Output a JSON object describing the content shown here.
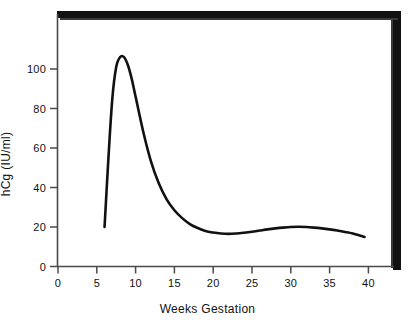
{
  "chart_data": {
    "type": "line",
    "title": "",
    "subtitle": "",
    "xlabel": "Weeks Gestation",
    "ylabel": "hCg (IU/ml)",
    "xlim": [
      0,
      43
    ],
    "ylim": [
      0,
      120
    ],
    "xticks": [
      0,
      5,
      10,
      15,
      20,
      25,
      30,
      35,
      40
    ],
    "yticks": [
      0,
      20,
      40,
      60,
      80,
      100
    ],
    "xtick_labels": [
      "0",
      "5",
      "10",
      "15",
      "20",
      "25",
      "30",
      "35",
      "40"
    ],
    "ytick_labels": [
      "0",
      "20",
      "40",
      "60",
      "80",
      "100"
    ],
    "grid": false,
    "legend": false,
    "legend_position": "none",
    "line_color": "#111111",
    "frame_color": "#000000",
    "series": [
      {
        "name": "hCg",
        "x": [
          6.0,
          6.5,
          7.0,
          7.5,
          8.0,
          8.5,
          9.0,
          9.5,
          10.0,
          11.0,
          12.0,
          13.0,
          14.0,
          15.0,
          16.0,
          17.0,
          18.0,
          19.0,
          20.0,
          21.0,
          22.0,
          23.0,
          24.0,
          25.0,
          26.0,
          27.0,
          28.0,
          29.0,
          30.0,
          31.0,
          32.0,
          33.0,
          34.0,
          35.0,
          36.0,
          37.0,
          38.0,
          39.5
        ],
        "y": [
          20.0,
          55.0,
          85.0,
          101.0,
          106.0,
          106.0,
          102.0,
          95.0,
          86.0,
          68.0,
          53.0,
          42.0,
          34.0,
          28.5,
          24.5,
          21.5,
          19.5,
          18.0,
          17.2,
          16.7,
          16.5,
          16.7,
          17.1,
          17.6,
          18.2,
          18.8,
          19.3,
          19.7,
          20.0,
          20.1,
          20.0,
          19.7,
          19.3,
          18.8,
          18.2,
          17.5,
          16.7,
          15.0
        ]
      }
    ],
    "annotations": {
      "peak_week": 8,
      "peak_value": 106,
      "trough_week": 22,
      "trough_value": 16.5,
      "secondary_peak_week": 31,
      "secondary_peak_value": 20,
      "start_week": 6,
      "start_value": 20,
      "end_week": 39.5,
      "end_value": 15
    }
  }
}
